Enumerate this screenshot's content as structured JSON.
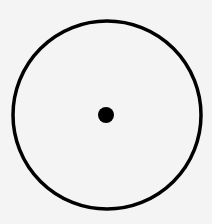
{
  "diagram": {
    "background": "#f4f4f4",
    "stroke_color": "#000000",
    "circle": {
      "cx": 107,
      "cy": 115,
      "r": 94,
      "stroke_width": 3.5
    },
    "center_dot": {
      "cx": 106,
      "cy": 115,
      "r": 8
    }
  }
}
